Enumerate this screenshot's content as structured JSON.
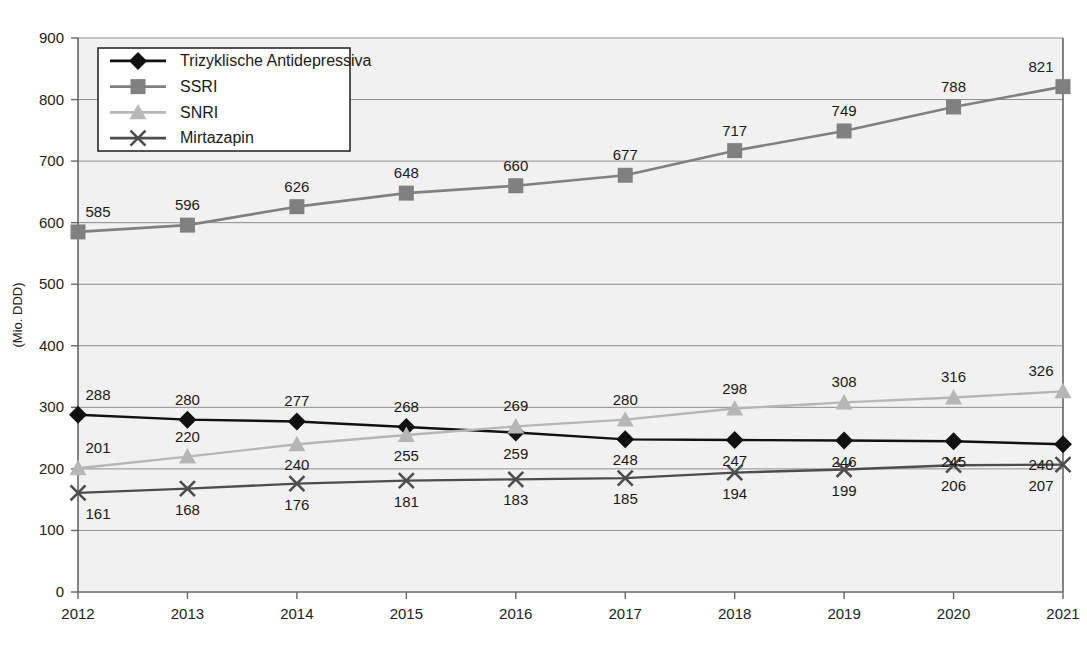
{
  "chart_data": {
    "type": "line",
    "title": "",
    "xlabel": "",
    "ylabel": "(Mio. DDD)",
    "categories": [
      "2012",
      "2013",
      "2014",
      "2015",
      "2016",
      "2017",
      "2018",
      "2019",
      "2020",
      "2021"
    ],
    "x": [
      2012,
      2013,
      2014,
      2015,
      2016,
      2017,
      2018,
      2019,
      2020,
      2021
    ],
    "ylim": [
      0,
      900
    ],
    "yticks": [
      0,
      100,
      200,
      300,
      400,
      500,
      600,
      700,
      800,
      900
    ],
    "ytick_labels": [
      "0",
      "100",
      "200",
      "300",
      "400",
      "500",
      "600",
      "700",
      "800",
      "900"
    ],
    "grid": true,
    "legend_position": "top-left",
    "series": [
      {
        "name": "Trizyklische Antidepressiva",
        "color": "#111111",
        "marker": "diamond",
        "values": [
          288,
          280,
          277,
          268,
          259,
          248,
          247,
          246,
          245,
          240
        ],
        "label_positions": [
          "above",
          "above",
          "above",
          "above",
          "below",
          "below",
          "below",
          "below",
          "below",
          "below"
        ]
      },
      {
        "name": "SSRI",
        "color": "#808080",
        "marker": "square",
        "values": [
          585,
          596,
          626,
          648,
          660,
          677,
          717,
          749,
          788,
          821
        ],
        "label_positions": [
          "above",
          "above",
          "above",
          "above",
          "above",
          "above",
          "above",
          "above",
          "above",
          "above"
        ]
      },
      {
        "name": "SNRI",
        "color": "#b6b6b6",
        "marker": "triangle",
        "values": [
          201,
          220,
          240,
          255,
          269,
          280,
          298,
          308,
          316,
          326
        ],
        "label_positions": [
          "above",
          "above",
          "below",
          "below",
          "above",
          "above",
          "above",
          "above",
          "above",
          "above"
        ]
      },
      {
        "name": "Mirtazapin",
        "color": "#4d4d4d",
        "marker": "cross",
        "values": [
          161,
          168,
          176,
          181,
          183,
          185,
          194,
          199,
          206,
          207
        ],
        "label_positions": [
          "below",
          "below",
          "below",
          "below",
          "below",
          "below",
          "below",
          "below",
          "below",
          "below"
        ]
      }
    ]
  },
  "legend": {
    "entries": [
      {
        "label": "Trizyklische Antidepressiva"
      },
      {
        "label": "SSRI"
      },
      {
        "label": "SNRI"
      },
      {
        "label": "Mirtazapin"
      }
    ]
  },
  "colors": {
    "plot_background": "#f1f1f1",
    "page_background": "#ffffff",
    "gridline": "#8d8d8d",
    "axis": "#666666",
    "text": "#1a1a1a",
    "series_tca": "#111111",
    "series_ssri": "#808080",
    "series_snri": "#b6b6b6",
    "series_mirtazapin": "#4d4d4d"
  }
}
